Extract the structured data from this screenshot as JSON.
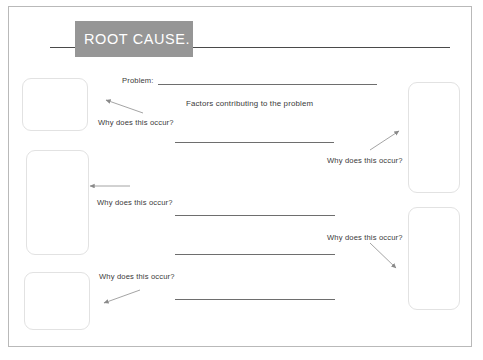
{
  "document": {
    "title": "ROOT CAUSE.",
    "frame": {
      "visible": true
    }
  },
  "fields": {
    "problem_label": "Problem:",
    "factors_label": "Factors contributing to the problem",
    "why_label": "Why does this occur?"
  },
  "left_column": {
    "prompts": [
      {
        "label": "Why does this occur?"
      },
      {
        "label": "Why does this occur?"
      },
      {
        "label": "Why does this occur?"
      }
    ],
    "boxes": [
      {
        "value": ""
      },
      {
        "value": ""
      },
      {
        "value": ""
      }
    ]
  },
  "right_column": {
    "prompts": [
      {
        "label": "Why does this occur?"
      },
      {
        "label": "Why does this occur?"
      }
    ],
    "boxes": [
      {
        "value": ""
      },
      {
        "value": ""
      }
    ]
  },
  "answer_lines": [
    {
      "value": ""
    },
    {
      "value": ""
    },
    {
      "value": ""
    },
    {
      "value": ""
    }
  ],
  "problem_line": {
    "value": ""
  },
  "colors": {
    "title_box": "#969696",
    "title_text": "#ffffff",
    "rule": "#6e6e6e",
    "frame": "#b9b9b9",
    "box_border": "#e2e2e2",
    "text": "#3a3a3a"
  }
}
